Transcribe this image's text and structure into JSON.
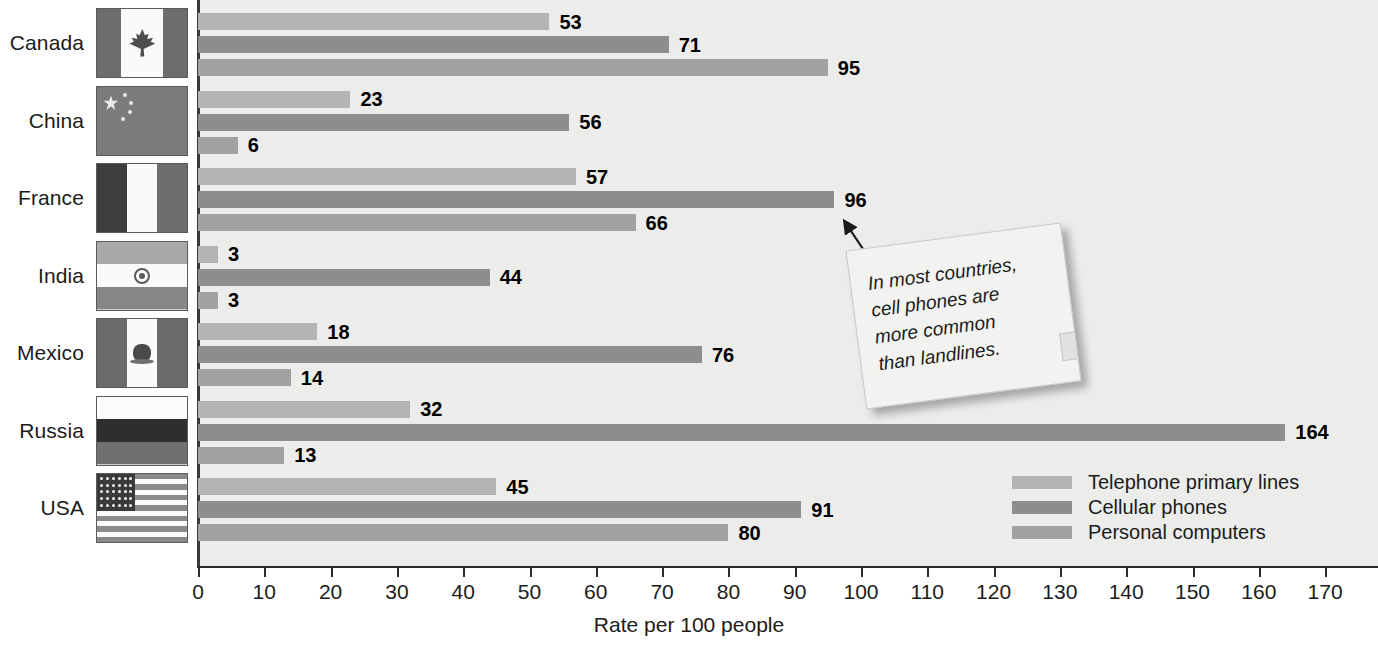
{
  "chart_data": {
    "type": "bar",
    "orientation": "horizontal",
    "title": "",
    "xlabel": "Rate per 100 people",
    "ylabel": "",
    "xlim": [
      0,
      175
    ],
    "xticks": [
      0,
      10,
      20,
      30,
      40,
      50,
      60,
      70,
      80,
      90,
      100,
      110,
      120,
      130,
      140,
      150,
      160,
      170
    ],
    "grid": false,
    "legend_position": "bottom-right",
    "categories": [
      "Canada",
      "China",
      "France",
      "India",
      "Mexico",
      "Russia",
      "USA"
    ],
    "series": [
      {
        "name": "Telephone primary lines",
        "color": "#b4b4b2",
        "values": [
          53,
          23,
          57,
          3,
          18,
          32,
          45
        ]
      },
      {
        "name": "Cellular phones",
        "color": "#8d8d8b",
        "values": [
          71,
          56,
          96,
          44,
          76,
          164,
          91
        ]
      },
      {
        "name": "Personal computers",
        "color": "#a2a2a0",
        "values": [
          95,
          6,
          66,
          3,
          14,
          13,
          80
        ]
      }
    ],
    "annotations": [
      {
        "name": "callout-note",
        "text": "In most countries, cell phones are more common than landlines.",
        "lines": [
          "In most countries,",
          "cell phones are",
          "more common",
          "than landlines."
        ],
        "points_to": {
          "category": "France",
          "series": "Cellular phones",
          "value": 96
        }
      }
    ]
  },
  "axis": {
    "x_title": "Rate per 100 people",
    "tick_labels": [
      "0",
      "10",
      "20",
      "30",
      "40",
      "50",
      "60",
      "70",
      "80",
      "90",
      "100",
      "110",
      "120",
      "130",
      "140",
      "150",
      "160",
      "170"
    ]
  },
  "countries": [
    {
      "label": "Canada",
      "flag": "flag-canada"
    },
    {
      "label": "China",
      "flag": "flag-china"
    },
    {
      "label": "France",
      "flag": "flag-france"
    },
    {
      "label": "India",
      "flag": "flag-india"
    },
    {
      "label": "Mexico",
      "flag": "flag-mexico"
    },
    {
      "label": "Russia",
      "flag": "flag-russia"
    },
    {
      "label": "USA",
      "flag": "flag-usa"
    }
  ],
  "legend": {
    "items": [
      {
        "label": "Telephone primary lines",
        "color": "#b4b4b2"
      },
      {
        "label": "Cellular phones",
        "color": "#8d8d8b"
      },
      {
        "label": "Personal computers",
        "color": "#a2a2a0"
      }
    ]
  },
  "colors": {
    "plot_background": "#ececeb",
    "axis": "#2c2c2c",
    "text": "#1b1b1b",
    "note_paper": "#f2f2f0"
  }
}
